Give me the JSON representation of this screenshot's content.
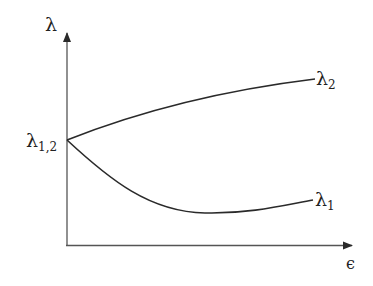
{
  "diagram": {
    "type": "eigenvalue-splitting-plot",
    "colors": {
      "background": "#ffffff",
      "stroke": "#2a2a2a",
      "text": "#222222"
    },
    "axes": {
      "y_label": "λ",
      "x_label": "ϵ"
    },
    "labels": {
      "degenerate_base": "λ",
      "degenerate_sub": "1,2",
      "upper_base": "λ",
      "upper_sub": "2",
      "lower_base": "λ",
      "lower_sub": "1"
    },
    "curves": [
      {
        "name": "lambda-2",
        "description": "upper branch, rises monotonically and flattens",
        "points": [
          [
            67,
            140
          ],
          [
            120,
            121
          ],
          [
            180,
            103
          ],
          [
            240,
            89
          ],
          [
            315,
            79
          ]
        ]
      },
      {
        "name": "lambda-1",
        "description": "lower branch, drops, reaches a minimum, then rises slightly",
        "points": [
          [
            67,
            140
          ],
          [
            110,
            180
          ],
          [
            160,
            205
          ],
          [
            205,
            213
          ],
          [
            260,
            209
          ],
          [
            313,
            200
          ]
        ]
      }
    ]
  }
}
